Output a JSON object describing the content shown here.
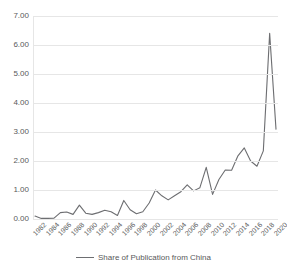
{
  "chart_data": {
    "type": "line",
    "title": "",
    "xlabel": "",
    "ylabel": "",
    "ylim": [
      0,
      7
    ],
    "ytick_step": 1,
    "ytick_labels": [
      "7.00",
      "6.00",
      "5.00",
      "4.00",
      "3.00",
      "2.00",
      "1.00",
      "0.00"
    ],
    "grid": true,
    "legend_position": "bottom-center",
    "line_color": "#6d6e71",
    "xtick_labels": [
      "1982",
      "1984",
      "1986",
      "1988",
      "1990",
      "1992",
      "1994",
      "1996",
      "1998",
      "2000",
      "2002",
      "2004",
      "2006",
      "2008",
      "2010",
      "2012",
      "2014",
      "2016",
      "2018",
      "2020"
    ],
    "x": [
      1982,
      1983,
      1984,
      1985,
      1986,
      1987,
      1988,
      1989,
      1990,
      1991,
      1992,
      1993,
      1994,
      1995,
      1996,
      1997,
      1998,
      1999,
      2000,
      2001,
      2002,
      2003,
      2004,
      2005,
      2006,
      2007,
      2008,
      2009,
      2010,
      2011,
      2012,
      2013,
      2014,
      2015,
      2016,
      2017,
      2018,
      2019,
      2020
    ],
    "series": [
      {
        "name": "Share of Publication from China",
        "values": [
          0.1,
          0.02,
          0.02,
          0.03,
          0.22,
          0.24,
          0.16,
          0.48,
          0.2,
          0.16,
          0.22,
          0.3,
          0.25,
          0.12,
          0.64,
          0.32,
          0.18,
          0.25,
          0.55,
          1.0,
          0.8,
          0.66,
          0.8,
          0.94,
          1.18,
          0.97,
          1.08,
          1.78,
          0.85,
          1.36,
          1.69,
          1.68,
          2.18,
          2.45,
          2.0,
          1.82,
          2.35,
          6.4,
          3.1
        ]
      }
    ],
    "legend": [
      {
        "label": "Share of Publication from China",
        "color": "#6d6e71"
      }
    ]
  },
  "legend": {
    "series_label": "Share of Publication from China"
  },
  "title_strip": {
    "text": ""
  }
}
